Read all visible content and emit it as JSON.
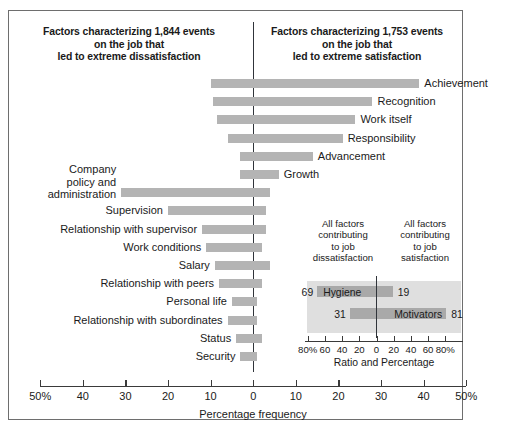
{
  "headings": {
    "left": "Factors characterizing 1,844 events\non the job that\nled to extreme dissatisfaction",
    "left_l1": "Factors characterizing 1,844 events",
    "left_l2": "on the job that",
    "left_l3": "led to extreme dissatisfaction",
    "right_l1": "Factors characterizing 1,753 events",
    "right_l2": "on the job that",
    "right_l3": "led to extreme satisfaction"
  },
  "axis": {
    "title": "Percentage frequency",
    "tick_labels": [
      "50%",
      "40",
      "30",
      "20",
      "10",
      "0",
      "10",
      "20",
      "30",
      "40",
      "50%"
    ],
    "tick_values": [
      -50,
      -40,
      -30,
      -20,
      -10,
      0,
      10,
      20,
      30,
      40,
      50
    ],
    "min": -50,
    "max": 50
  },
  "inset": {
    "header_left_l1": "All factors",
    "header_left_l2": "contributing",
    "header_left_l3": "to job",
    "header_left_l4": "dissatisfaction",
    "header_right_l1": "All factors",
    "header_right_l2": "contributing",
    "header_right_l3": "to job",
    "header_right_l4": "satisfaction",
    "title": "Ratio and Percentage",
    "tick_labels": [
      "80%",
      "60",
      "40",
      "20",
      "0",
      "20",
      "40",
      "60",
      "80%"
    ],
    "tick_values": [
      -80,
      -60,
      -40,
      -20,
      0,
      20,
      40,
      60,
      80
    ],
    "rows": [
      {
        "name": "Hygiene",
        "left_value": 69,
        "right_value": 19,
        "left_label": "69",
        "right_label": "19"
      },
      {
        "name": "Motivators",
        "left_value": 31,
        "right_value": 81,
        "left_label": "31",
        "right_label": "81"
      }
    ],
    "colors": {
      "background": "#dfdfdf",
      "bar": "#a9a9a9"
    }
  },
  "colors": {
    "bar": "#b4b4b4",
    "axis": "#30343a",
    "frame": "#6e6e6e",
    "text": "#1a1a1a"
  },
  "chart_data": {
    "type": "bar",
    "xlabel": "Percentage frequency",
    "ylabel": "",
    "xlim": [
      -50,
      50
    ],
    "grid": false,
    "legend": "none",
    "orientation": "horizontal",
    "note": "Each factor is a single horizontal bar spanning from a negative (dissatisfaction) percentage to a positive (satisfaction) percentage.",
    "categories": [
      "Achievement",
      "Recognition",
      "Work itself",
      "Responsibility",
      "Advancement",
      "Growth",
      "Company policy and administration",
      "Supervision",
      "Relationship with supervisor",
      "Work conditions",
      "Salary",
      "Relationship with peers",
      "Personal life",
      "Relationship with subordinates",
      "Status",
      "Security"
    ],
    "series": [
      {
        "name": "Dissatisfaction side (%)",
        "values": [
          -10,
          -9.5,
          -8.5,
          -6,
          -3,
          -3,
          -31,
          -20,
          -12,
          -11,
          -9,
          -8,
          -5,
          -6,
          -4,
          -3
        ]
      },
      {
        "name": "Satisfaction side (%)",
        "values": [
          39,
          28,
          24,
          21,
          14,
          6,
          4,
          3,
          3,
          2,
          4,
          2,
          1,
          1,
          2,
          1
        ]
      }
    ],
    "bars": [
      {
        "label": "Achievement",
        "from": -10,
        "to": 39,
        "label_side": "right"
      },
      {
        "label": "Recognition",
        "from": -9.5,
        "to": 28,
        "label_side": "right"
      },
      {
        "label": "Work itself",
        "from": -8.5,
        "to": 24,
        "label_side": "right"
      },
      {
        "label": "Responsibility",
        "from": -6,
        "to": 21,
        "label_side": "right"
      },
      {
        "label": "Advancement",
        "from": -3,
        "to": 14,
        "label_side": "right"
      },
      {
        "label": "Growth",
        "from": -3,
        "to": 6,
        "label_side": "right"
      },
      {
        "label": "Company policy and administration",
        "from": -31,
        "to": 4,
        "label_side": "left"
      },
      {
        "label": "Supervision",
        "from": -20,
        "to": 3,
        "label_side": "left"
      },
      {
        "label": "Relationship with supervisor",
        "from": -12,
        "to": 3,
        "label_side": "left"
      },
      {
        "label": "Work conditions",
        "from": -11,
        "to": 2,
        "label_side": "left"
      },
      {
        "label": "Salary",
        "from": -9,
        "to": 4,
        "label_side": "left"
      },
      {
        "label": "Relationship with peers",
        "from": -8,
        "to": 2,
        "label_side": "left"
      },
      {
        "label": "Personal life",
        "from": -5,
        "to": 1,
        "label_side": "left"
      },
      {
        "label": "Relationship with subordinates",
        "from": -6,
        "to": 1,
        "label_side": "left"
      },
      {
        "label": "Status",
        "from": -4,
        "to": 2,
        "label_side": "left"
      },
      {
        "label": "Security",
        "from": -3,
        "to": 1,
        "label_side": "left"
      }
    ],
    "inset_chart": {
      "type": "bar",
      "title": "Ratio and Percentage",
      "xlim": [
        -100,
        100
      ],
      "categories": [
        "Hygiene",
        "Motivators"
      ],
      "series": [
        {
          "name": "Contributing to job dissatisfaction (%)",
          "values": [
            69,
            31
          ]
        },
        {
          "name": "Contributing to job satisfaction (%)",
          "values": [
            19,
            81
          ]
        }
      ]
    }
  }
}
